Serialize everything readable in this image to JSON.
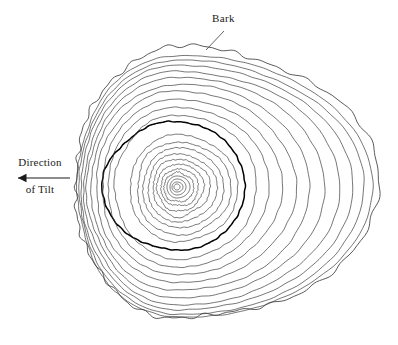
{
  "figure": {
    "kind": "tree-ring-cross-section",
    "background_color": "#ffffff",
    "line_color": "#3c3c3c",
    "bold_ring_color": "#000000",
    "text_color": "#1a1a1a"
  },
  "labels": {
    "bark": "Bark",
    "tilt_line1": "Direction",
    "tilt_line2": "of Tilt"
  },
  "annotations": {
    "bark_leader": {
      "from_x": 224,
      "from_y": 31,
      "to_x": 206,
      "to_y": 50
    },
    "tilt_arrow": {
      "x_start": 70,
      "x_end": 18,
      "y": 178,
      "direction": "left",
      "head_size": 5
    }
  },
  "chart_data": {
    "type": "scatter",
    "xlabel": "",
    "ylabel": "",
    "pith": {
      "x": 177,
      "y": 187
    },
    "ring_count": 24,
    "bold_ring_index": 13,
    "bark_index": 24,
    "bark_bounds": {
      "left": 75,
      "right": 380,
      "top": 47,
      "bottom": 318
    },
    "bold_ring_bounds": {
      "left": 103,
      "right": 245,
      "top": 122,
      "bottom": 250
    },
    "notes": [
      "Rings are widely spaced on the right side (away from tilt)",
      "Rings are compressed on the left side (toward tilt)",
      "Outermost bark outline is irregular and bumpy",
      "Inner rings are smooth closed curves"
    ],
    "rings": [
      {
        "i": 1,
        "rx_right": 3,
        "rx_left": 3,
        "ry_top": 3,
        "ry_bottom": 3,
        "bold": false
      },
      {
        "i": 2,
        "rx_right": 6,
        "rx_left": 5,
        "ry_top": 5,
        "ry_bottom": 5,
        "bold": false
      },
      {
        "i": 3,
        "rx_right": 9,
        "rx_left": 7,
        "ry_top": 8,
        "ry_bottom": 8,
        "bold": false
      },
      {
        "i": 4,
        "rx_right": 13,
        "rx_left": 10,
        "ry_top": 11,
        "ry_bottom": 11,
        "bold": false
      },
      {
        "i": 5,
        "rx_right": 17,
        "rx_left": 13,
        "ry_top": 14,
        "ry_bottom": 15,
        "bold": false
      },
      {
        "i": 6,
        "rx_right": 22,
        "rx_left": 16,
        "ry_top": 18,
        "ry_bottom": 19,
        "bold": false
      },
      {
        "i": 7,
        "rx_right": 27,
        "rx_left": 20,
        "ry_top": 23,
        "ry_bottom": 24,
        "bold": false
      },
      {
        "i": 8,
        "rx_right": 33,
        "rx_left": 24,
        "ry_top": 28,
        "ry_bottom": 29,
        "bold": false
      },
      {
        "i": 9,
        "rx_right": 40,
        "rx_left": 29,
        "ry_top": 33,
        "ry_bottom": 35,
        "bold": false
      },
      {
        "i": 10,
        "rx_right": 47,
        "rx_left": 34,
        "ry_top": 39,
        "ry_bottom": 41,
        "bold": false
      },
      {
        "i": 11,
        "rx_right": 54,
        "rx_left": 40,
        "ry_top": 45,
        "ry_bottom": 48,
        "bold": false
      },
      {
        "i": 12,
        "rx_right": 61,
        "rx_left": 47,
        "ry_top": 52,
        "ry_bottom": 55,
        "bold": false
      },
      {
        "i": 13,
        "rx_right": 68,
        "rx_left": 74,
        "ry_top": 65,
        "ry_bottom": 63,
        "bold": true
      },
      {
        "i": 14,
        "rx_right": 80,
        "rx_left": 62,
        "ry_top": 72,
        "ry_bottom": 72,
        "bold": false
      },
      {
        "i": 15,
        "rx_right": 92,
        "rx_left": 69,
        "ry_top": 80,
        "ry_bottom": 80,
        "bold": false
      },
      {
        "i": 16,
        "rx_right": 105,
        "rx_left": 75,
        "ry_top": 88,
        "ry_bottom": 88,
        "bold": false
      },
      {
        "i": 17,
        "rx_right": 119,
        "rx_left": 81,
        "ry_top": 96,
        "ry_bottom": 96,
        "bold": false
      },
      {
        "i": 18,
        "rx_right": 133,
        "rx_left": 86,
        "ry_top": 103,
        "ry_bottom": 104,
        "bold": false
      },
      {
        "i": 19,
        "rx_right": 148,
        "rx_left": 90,
        "ry_top": 110,
        "ry_bottom": 111,
        "bold": false
      },
      {
        "i": 20,
        "rx_right": 163,
        "rx_left": 93,
        "ry_top": 116,
        "ry_bottom": 118,
        "bold": false
      },
      {
        "i": 21,
        "rx_right": 176,
        "rx_left": 96,
        "ry_top": 122,
        "ry_bottom": 123,
        "bold": false
      },
      {
        "i": 22,
        "rx_right": 187,
        "rx_left": 98,
        "ry_top": 127,
        "ry_bottom": 128,
        "bold": false
      },
      {
        "i": 23,
        "rx_right": 196,
        "rx_left": 100,
        "ry_top": 132,
        "ry_bottom": 131,
        "bold": false
      },
      {
        "i": 24,
        "rx_right": 203,
        "rx_left": 102,
        "ry_top": 140,
        "ry_bottom": 131,
        "bold": false
      }
    ]
  }
}
